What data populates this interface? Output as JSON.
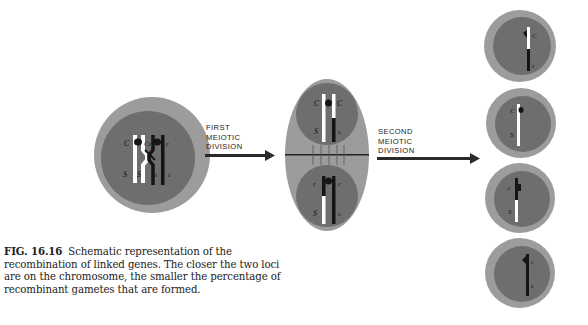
{
  "figure": {
    "labels": {
      "first_division": [
        "FIRST",
        "MEIOTIC",
        "DIVISION"
      ],
      "second_division": [
        "SECOND",
        "MEIOTIC",
        "DIVISION"
      ]
    },
    "loci": {
      "C_upper": "C",
      "c_lower": "c",
      "S_upper": "S",
      "s_lower": "s"
    },
    "colors": {
      "background": "#ffffff",
      "cell_outer": "#9c9c9c",
      "cell_inner": "#6e6e6e",
      "chromosome_light": "#ffffff",
      "chromosome_dark": "#151515",
      "arrow": "#2a2a2a"
    },
    "stages": [
      {
        "name": "parent-cell",
        "description": "Tetrad with crossing over between C and S loci"
      },
      {
        "name": "first-division-cell",
        "description": "Cell dividing after first meiotic division"
      },
      {
        "name": "gamete-1",
        "genotype": "C s",
        "type": "recombinant"
      },
      {
        "name": "gamete-2",
        "genotype": "C S",
        "type": "parental"
      },
      {
        "name": "gamete-3",
        "genotype": "c S",
        "type": "recombinant"
      },
      {
        "name": "gamete-4",
        "genotype": "c s",
        "type": "parental"
      }
    ]
  },
  "caption": {
    "number": "FIG. 16.16",
    "text": "Schematic representation of the recombination of linked genes. The closer the two loci are on the chromosome, the smaller the percentage of recombinant gametes that are formed."
  }
}
